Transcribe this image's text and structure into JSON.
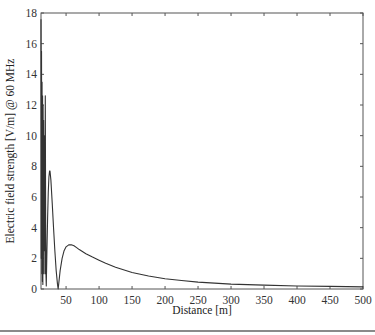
{
  "chart_data": {
    "type": "line",
    "title": "",
    "xlabel": "Distance [m]",
    "ylabel": "Electric field strength [V/m] @ 60 MHz",
    "xlim": [
      12,
      500
    ],
    "ylim": [
      0,
      18
    ],
    "xticks": [
      50,
      100,
      150,
      200,
      250,
      300,
      350,
      400,
      450,
      500
    ],
    "yticks": [
      0,
      2,
      4,
      6,
      8,
      10,
      12,
      14,
      16,
      18
    ],
    "grid": false,
    "legend": null,
    "series": [
      {
        "name": "E-field",
        "color": "#333333",
        "x": [
          12,
          12.4,
          12.8,
          13.2,
          13.6,
          14.0,
          14.4,
          14.8,
          15.2,
          15.6,
          16.0,
          16.4,
          16.8,
          17.2,
          17.6,
          18.0,
          18.5,
          19.0,
          19.5,
          20.0,
          21,
          22,
          23,
          24,
          25,
          25.6,
          27,
          29,
          31,
          33,
          35,
          37,
          38,
          39,
          41,
          44,
          47,
          50,
          54,
          58,
          62,
          66,
          70,
          80,
          90,
          100,
          110,
          125,
          150,
          175,
          200,
          225,
          250,
          275,
          300,
          350,
          400,
          450,
          500
        ],
        "y": [
          17.6,
          2.0,
          15.5,
          1.0,
          13.5,
          0.5,
          12.6,
          0.3,
          12.0,
          1.0,
          11.0,
          2.5,
          10.0,
          4.0,
          9.0,
          1.0,
          12.6,
          5.0,
          1.0,
          0.2,
          2.5,
          4.6,
          6.3,
          7.3,
          7.7,
          7.7,
          7.1,
          5.6,
          4.0,
          2.5,
          1.2,
          0.3,
          0.0,
          0.4,
          1.2,
          2.0,
          2.5,
          2.75,
          2.88,
          2.88,
          2.82,
          2.7,
          2.57,
          2.3,
          2.08,
          1.88,
          1.68,
          1.42,
          1.08,
          0.85,
          0.67,
          0.55,
          0.45,
          0.38,
          0.32,
          0.25,
          0.2,
          0.17,
          0.14
        ]
      }
    ]
  },
  "axes": {
    "x_tick_labels": [
      "50",
      "100",
      "150",
      "200",
      "250",
      "300",
      "350",
      "400",
      "450",
      "500"
    ],
    "y_tick_labels": [
      "0",
      "2",
      "4",
      "6",
      "8",
      "10",
      "12",
      "14",
      "16",
      "18"
    ],
    "xlabel": "Distance [m]",
    "ylabel": "Electric field strength [V/m] @ 60 MHz"
  }
}
